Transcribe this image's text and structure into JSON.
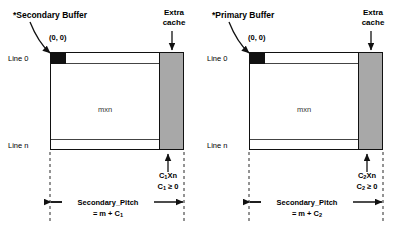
{
  "figure": {
    "panels": [
      {
        "id": "secondary",
        "buffer_title": "*Secondary Buffer",
        "origin_label": "(0, 0)",
        "line_first_label": "Line 0",
        "line_last_label": "Line n",
        "area_label": "mxn",
        "extra_cache_label_line1": "Extra",
        "extra_cache_label_line2": "cache",
        "cache_size_label": "C",
        "cache_size_sub": "1",
        "cache_size_rest": "Xn",
        "cache_constraint_label": "C",
        "cache_constraint_sub": "1",
        "cache_constraint_rest": " ≥ 0",
        "pitch_label": "Secondary_Pitch",
        "pitch_formula_prefix": "= m + C",
        "pitch_formula_sub": "1"
      },
      {
        "id": "primary",
        "buffer_title": "*Primary Buffer",
        "origin_label": "(0, 0)",
        "line_first_label": "Line 0",
        "line_last_label": "Line n",
        "area_label": "mxn",
        "extra_cache_label_line1": "Extra",
        "extra_cache_label_line2": "cache",
        "cache_size_label": "C",
        "cache_size_sub": "2",
        "cache_size_rest": "Xn",
        "cache_constraint_label": "C",
        "cache_constraint_sub": "2",
        "cache_constraint_rest": " ≥ 0",
        "pitch_label": "Secondary_Pitch",
        "pitch_formula_prefix": "= m + C",
        "pitch_formula_sub": "2"
      }
    ],
    "colors": {
      "stroke": "#111111",
      "cache_fill": "#a8a8a8",
      "buffer_fill": "#ffffff",
      "origin_fill": "#111111",
      "background": "#ffffff"
    }
  }
}
